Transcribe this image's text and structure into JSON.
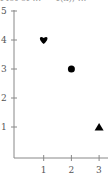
{
  "caption": "Plot of ... = 4(x), ...",
  "chart_data": {
    "type": "scatter",
    "title": "",
    "xlabel": "",
    "ylabel": "",
    "xlim": [
      0,
      3.2
    ],
    "ylim": [
      0,
      5
    ],
    "x_ticks": [
      "1",
      "2",
      "3"
    ],
    "y_ticks": [
      "1",
      "2",
      "3",
      "4",
      "5"
    ],
    "grid": false,
    "points": [
      {
        "x": 1,
        "y": 4,
        "marker": "heart"
      },
      {
        "x": 2,
        "y": 3,
        "marker": "circle"
      },
      {
        "x": 3,
        "y": 1,
        "marker": "triangle"
      }
    ]
  },
  "colors": {
    "axis": "#888888",
    "marker": "#000000"
  }
}
